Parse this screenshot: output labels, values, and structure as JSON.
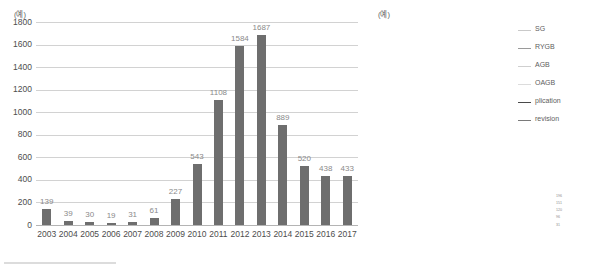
{
  "figure": {
    "bottom_rule": ""
  },
  "bar_panel": {
    "unit": "(예)",
    "yticks": [
      "0",
      "200",
      "400",
      "600",
      "800",
      "1000",
      "1200",
      "1400",
      "1600",
      "1800"
    ]
  },
  "line_panel": {
    "unit": "(예)",
    "yticks": [
      "0",
      "200",
      "400",
      "600",
      "800",
      "1000",
      "1200",
      "1400"
    ]
  },
  "legend": {
    "items": [
      {
        "label": "SG",
        "color": "#c9c9c9"
      },
      {
        "label": "RYGB",
        "color": "#9a9a9a"
      },
      {
        "label": "AGB",
        "color": "#cfcfcf"
      },
      {
        "label": "OAGB",
        "color": "#dcdcdc"
      },
      {
        "label": "plication",
        "color": "#4a4a4a"
      },
      {
        "label": "revision",
        "color": "#7a7a7a"
      }
    ]
  },
  "end_labels": [
    "196",
    "151",
    "120",
    "96",
    "31"
  ],
  "chart_data": [
    {
      "type": "bar",
      "title": "",
      "xlabel": "",
      "ylabel": "",
      "unit": "(예)",
      "categories": [
        "2003",
        "2004",
        "2005",
        "2006",
        "2007",
        "2008",
        "2009",
        "2010",
        "2011",
        "2012",
        "2013",
        "2014",
        "2015",
        "2016",
        "2017"
      ],
      "values": [
        139,
        39,
        30,
        19,
        31,
        61,
        227,
        543,
        1108,
        1584,
        1687,
        889,
        520,
        438,
        433
      ],
      "ylim": [
        0,
        1800
      ],
      "ytick_step": 200,
      "grid": true,
      "bar_color": "#6e6e6e",
      "value_label_color": "#8a8a8a",
      "legend": "none"
    },
    {
      "type": "line",
      "title": "",
      "xlabel": "",
      "ylabel": "",
      "unit": "(예)",
      "x": [
        "2013",
        "2014",
        "2015",
        "2016",
        "2017"
      ],
      "ylim": [
        0,
        1400
      ],
      "ytick_step": 200,
      "grid": true,
      "legend_position": "right",
      "series": [
        {
          "name": "SG",
          "color": "#c9c9c9",
          "width": 1.0,
          "values": [
            1215,
            420,
            60,
            150,
            196
          ]
        },
        {
          "name": "RYGB",
          "color": "#9a9a9a",
          "width": 1.0,
          "values": [
            200,
            130,
            190,
            88,
            120
          ]
        },
        {
          "name": "AGB",
          "color": "#cfcfcf",
          "width": 1.0,
          "values": [
            225,
            165,
            105,
            175,
            151
          ]
        },
        {
          "name": "OAGB",
          "color": "#dcdcdc",
          "width": 1.0,
          "values": [
            196,
            150,
            70,
            55,
            96
          ]
        },
        {
          "name": "plication",
          "color": "#4a4a4a",
          "width": 1.4,
          "values": [
            18,
            40,
            36,
            34,
            31
          ]
        },
        {
          "name": "revision",
          "color": "#7a7a7a",
          "width": 1.1,
          "values": [
            22,
            105,
            185,
            120,
            40
          ]
        }
      ]
    }
  ]
}
